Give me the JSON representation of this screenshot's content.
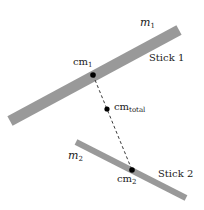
{
  "diagram": {
    "title": "",
    "colors": {
      "stick": "#999999",
      "point": "#000000",
      "line": "#222222",
      "text": "#222222"
    },
    "sticks": [
      {
        "id": "stick1",
        "label": "Stick 1",
        "mass_symbol": "m",
        "mass_sub": "1"
      },
      {
        "id": "stick2",
        "label": "Stick 2",
        "mass_symbol": "m",
        "mass_sub": "2"
      }
    ],
    "points": [
      {
        "id": "cm1",
        "label": "cm",
        "sub": "1"
      },
      {
        "id": "cm_total",
        "label": "cm",
        "sub": "total"
      },
      {
        "id": "cm2",
        "label": "cm",
        "sub": "2"
      }
    ],
    "connector": "dashed line from cm1 through cm_total to cm2"
  }
}
